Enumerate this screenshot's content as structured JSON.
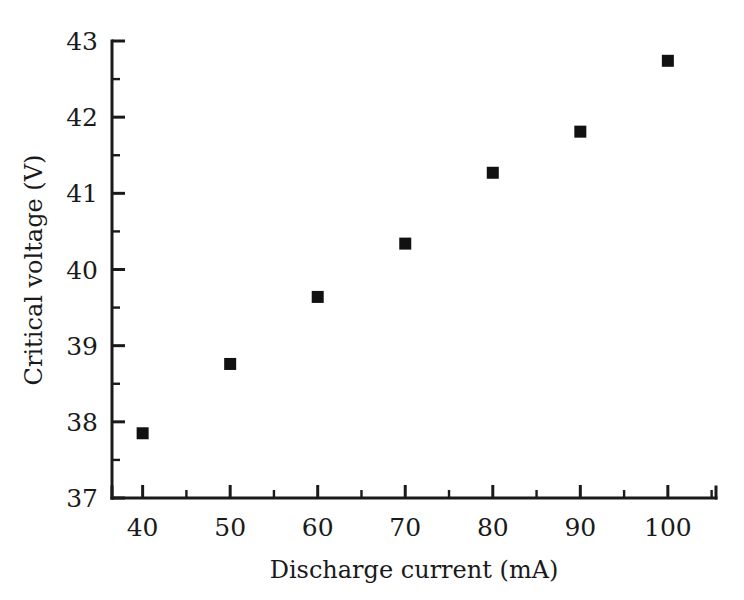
{
  "chart_data": {
    "type": "scatter",
    "title": "",
    "xlabel": "Discharge current (mA)",
    "ylabel": "Critical voltage (V)",
    "x": [
      40,
      50,
      60,
      70,
      80,
      90,
      100
    ],
    "values": [
      37.85,
      38.76,
      39.64,
      40.34,
      41.27,
      41.81,
      42.74
    ],
    "series": [
      {
        "name": "Critical voltage",
        "marker": "filled-square",
        "color": "#111111",
        "x": [
          40,
          50,
          60,
          70,
          80,
          90,
          100
        ],
        "values": [
          37.85,
          38.76,
          39.64,
          40.34,
          41.27,
          41.81,
          42.74
        ]
      }
    ],
    "xlim": [
      36.5,
      105.5
    ],
    "ylim": [
      37,
      43
    ],
    "xticks": [
      40,
      50,
      60,
      70,
      80,
      90,
      100
    ],
    "xtick_labels": [
      "40",
      "50",
      "60",
      "70",
      "80",
      "90",
      "100"
    ],
    "xminor_ticks": [
      45,
      55,
      65,
      75,
      85,
      95,
      105
    ],
    "yticks": [
      37,
      38,
      39,
      40,
      41,
      42,
      43
    ],
    "ytick_labels": [
      "37",
      "38",
      "39",
      "40",
      "41",
      "42",
      "43"
    ],
    "yminor_ticks": [
      37.5,
      38.5,
      39.5,
      40.5,
      41.5,
      42.5
    ],
    "grid": false,
    "legend": null,
    "legend_position": "none",
    "spines": [
      "left",
      "bottom"
    ],
    "tick_direction": "in",
    "background_color": "#ffffff",
    "foreground_color": "#1a1a1a"
  }
}
